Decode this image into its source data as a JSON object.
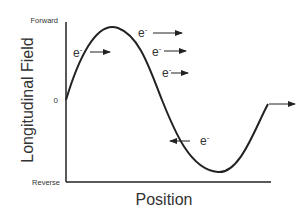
{
  "diagram": {
    "y_axis": {
      "title": "Longitudinal Field",
      "top_label": "Forward",
      "zero_label": "0",
      "bottom_label": "Reverse"
    },
    "x_axis": {
      "title": "Position"
    },
    "electrons": [
      {
        "label": "e",
        "charge": "-",
        "direction": "forward",
        "position": "rising slope"
      },
      {
        "label": "e",
        "charge": "-",
        "direction": "forward",
        "position": "past peak (top)"
      },
      {
        "label": "e",
        "charge": "-",
        "direction": "forward",
        "position": "past peak (middle)"
      },
      {
        "label": "e",
        "charge": "-",
        "direction": "forward",
        "position": "past peak (lower)"
      },
      {
        "label": "e",
        "charge": "-",
        "direction": "reverse",
        "position": "falling slope below zero"
      }
    ],
    "curve": "sinusoidal field vs position",
    "line_color": "#222222"
  }
}
